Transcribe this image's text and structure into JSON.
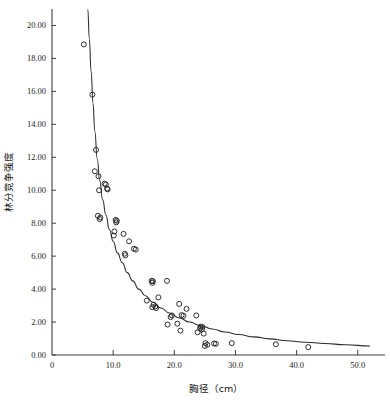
{
  "chart_data": {
    "type": "scatter",
    "title": "",
    "xlabel": "胸径（cm）",
    "ylabel": "林分竞争强度",
    "xlim": [
      0,
      52
    ],
    "ylim": [
      0,
      21
    ],
    "grid": false,
    "legend": null,
    "x_ticks": [
      0,
      10,
      20,
      30,
      40,
      50
    ],
    "x_tick_labels": [
      "0",
      "10.0",
      "20.0",
      "30.0",
      "40.0",
      "50.0"
    ],
    "y_ticks": [
      0,
      2,
      4,
      6,
      8,
      10,
      12,
      14,
      16,
      18,
      20
    ],
    "y_tick_labels": [
      "0.00",
      "2.00",
      "4.00",
      "6.00",
      "8.00",
      "10.00",
      "12.00",
      "14.00",
      "16.00",
      "18.00",
      "20.00"
    ],
    "marker": "open-circle",
    "marker_color": "#242424",
    "curve_color": "#2a2a2a",
    "axis_color": "#3d3d3d",
    "points": [
      [
        5.2,
        18.85
      ],
      [
        6.6,
        15.8
      ],
      [
        7.2,
        12.45
      ],
      [
        7.0,
        11.15
      ],
      [
        7.6,
        10.85
      ],
      [
        8.6,
        10.4
      ],
      [
        8.8,
        10.35
      ],
      [
        9.0,
        10.1
      ],
      [
        9.1,
        10.05
      ],
      [
        7.7,
        10.0
      ],
      [
        7.5,
        8.45
      ],
      [
        7.9,
        8.35
      ],
      [
        7.8,
        8.25
      ],
      [
        10.4,
        8.2
      ],
      [
        10.6,
        8.15
      ],
      [
        10.5,
        8.05
      ],
      [
        10.2,
        7.5
      ],
      [
        11.7,
        7.35
      ],
      [
        10.1,
        7.25
      ],
      [
        12.6,
        6.9
      ],
      [
        13.4,
        6.45
      ],
      [
        13.7,
        6.4
      ],
      [
        11.9,
        6.15
      ],
      [
        12.0,
        6.05
      ],
      [
        16.3,
        4.5
      ],
      [
        16.5,
        4.48
      ],
      [
        18.8,
        4.5
      ],
      [
        16.4,
        4.38
      ],
      [
        15.5,
        3.3
      ],
      [
        17.4,
        3.5
      ],
      [
        20.8,
        3.1
      ],
      [
        16.6,
        3.05
      ],
      [
        16.9,
        2.95
      ],
      [
        16.4,
        2.9
      ],
      [
        17.0,
        2.85
      ],
      [
        22.0,
        2.8
      ],
      [
        23.6,
        2.4
      ],
      [
        19.6,
        2.4
      ],
      [
        21.2,
        2.42
      ],
      [
        21.5,
        2.38
      ],
      [
        19.4,
        2.3
      ],
      [
        20.5,
        1.9
      ],
      [
        18.9,
        1.85
      ],
      [
        24.3,
        1.72
      ],
      [
        24.6,
        1.7
      ],
      [
        24.2,
        1.6
      ],
      [
        24.5,
        1.55
      ],
      [
        21.0,
        1.48
      ],
      [
        23.8,
        1.38
      ],
      [
        24.8,
        1.3
      ],
      [
        25.1,
        0.72
      ],
      [
        25.4,
        0.62
      ],
      [
        25.0,
        0.55
      ],
      [
        26.5,
        0.7
      ],
      [
        26.8,
        0.68
      ],
      [
        29.4,
        0.72
      ],
      [
        36.6,
        0.65
      ],
      [
        41.9,
        0.48
      ]
    ],
    "fit_curve": {
      "description": "monotone decreasing power/exponential decay fit",
      "points": [
        [
          5.85,
          21.0
        ],
        [
          6.1,
          19.2
        ],
        [
          6.4,
          17.2
        ],
        [
          6.7,
          15.3
        ],
        [
          7.0,
          13.6
        ],
        [
          7.4,
          11.9
        ],
        [
          7.8,
          10.6
        ],
        [
          8.3,
          9.4
        ],
        [
          8.8,
          8.5
        ],
        [
          9.4,
          7.6
        ],
        [
          10.0,
          6.9
        ],
        [
          10.7,
          6.2
        ],
        [
          11.5,
          5.6
        ],
        [
          12.3,
          5.0
        ],
        [
          13.2,
          4.5
        ],
        [
          14.2,
          4.0
        ],
        [
          15.3,
          3.6
        ],
        [
          16.5,
          3.2
        ],
        [
          17.8,
          2.85
        ],
        [
          19.2,
          2.55
        ],
        [
          20.8,
          2.25
        ],
        [
          22.5,
          2.0
        ],
        [
          24.3,
          1.78
        ],
        [
          26.2,
          1.58
        ],
        [
          28.3,
          1.4
        ],
        [
          30.5,
          1.25
        ],
        [
          33.0,
          1.1
        ],
        [
          35.6,
          0.98
        ],
        [
          38.4,
          0.87
        ],
        [
          41.4,
          0.78
        ],
        [
          44.6,
          0.7
        ],
        [
          48.0,
          0.62
        ],
        [
          52.0,
          0.55
        ]
      ]
    }
  }
}
